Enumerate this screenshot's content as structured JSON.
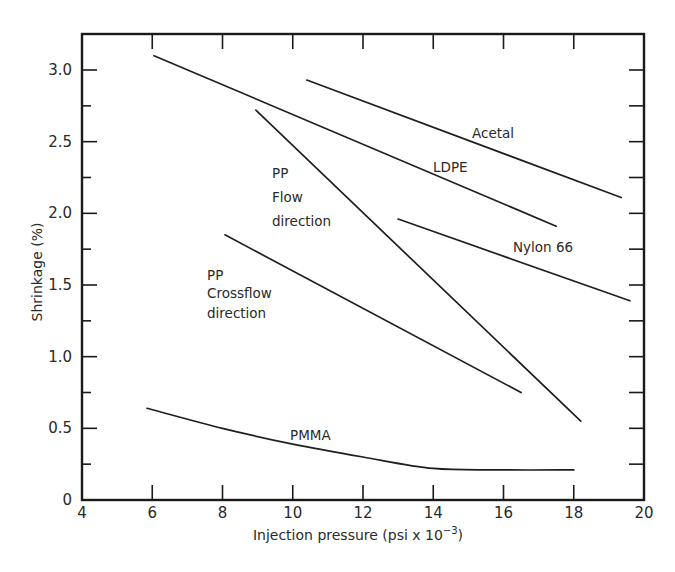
{
  "chart_data": {
    "type": "line",
    "title": "",
    "xlabel": "Injection pressure (psi x 10^-3)",
    "xlabel_main": "Injection pressure (psi x 10",
    "xlabel_exp": "−3",
    "xlabel_close": ")",
    "ylabel": "Shrinkage (%)",
    "xlim": [
      4,
      20
    ],
    "ylim": [
      0,
      3.25
    ],
    "grid": false,
    "legend": "inline labels",
    "x_ticks": [
      4,
      6,
      8,
      10,
      12,
      14,
      16,
      18,
      20
    ],
    "x_tick_labels": [
      "4",
      "6",
      "8",
      "10",
      "12",
      "14",
      "16",
      "18",
      "20"
    ],
    "y_ticks": [
      0,
      0.5,
      1.0,
      1.5,
      2.0,
      2.5,
      3.0
    ],
    "y_tick_labels": [
      "0",
      "0.5",
      "1.0",
      "1.5",
      "2.0",
      "2.5",
      "3.0"
    ],
    "y_minor_ticks": [
      0.25,
      0.75,
      1.25,
      1.75,
      2.25,
      2.75
    ],
    "series": [
      {
        "name": "Acetal",
        "label_lines": [
          "Acetal"
        ],
        "x": [
          10.4,
          19.35
        ],
        "y": [
          2.93,
          2.11
        ]
      },
      {
        "name": "LDPE",
        "label_lines": [
          "LDPE"
        ],
        "x": [
          6.05,
          17.5
        ],
        "y": [
          3.1,
          1.91
        ]
      },
      {
        "name": "PP Flow direction",
        "label_lines": [
          "PP",
          "Flow",
          "direction"
        ],
        "x": [
          8.95,
          18.2
        ],
        "y": [
          2.72,
          0.55
        ]
      },
      {
        "name": "Nylon 66",
        "label_lines": [
          "Nylon  66"
        ],
        "x": [
          13.0,
          19.6
        ],
        "y": [
          1.96,
          1.39
        ]
      },
      {
        "name": "PP Crossflow direction",
        "label_lines": [
          "PP",
          "Crossflow",
          "direction"
        ],
        "x": [
          8.07,
          16.5
        ],
        "y": [
          1.85,
          0.75
        ]
      },
      {
        "name": "PMMA",
        "label_lines": [
          "PMMA"
        ],
        "x": [
          5.85,
          8.0,
          10.0,
          12.0,
          14.0,
          16.0,
          18.0
        ],
        "y": [
          0.64,
          0.5,
          0.39,
          0.3,
          0.22,
          0.21,
          0.21
        ]
      }
    ]
  }
}
